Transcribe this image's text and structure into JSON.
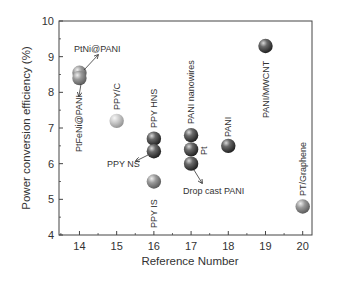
{
  "chart_data": {
    "type": "scatter",
    "title": "",
    "xlabel": "Reference Number",
    "ylabel": "Power conversion efficiency (%)",
    "xlim": [
      13.45,
      20.25
    ],
    "ylim": [
      4,
      10
    ],
    "xticks": [
      14,
      15,
      16,
      17,
      18,
      19,
      20
    ],
    "yticks": [
      4,
      5,
      6,
      7,
      8,
      9,
      10
    ],
    "grid": false,
    "legend": "none",
    "points": [
      {
        "x": 14,
        "y": 8.55,
        "label": "PtNi@PANI",
        "shade": "gray"
      },
      {
        "x": 14,
        "y": 8.4,
        "label": "PtFeNi@PANI",
        "shade": "gray"
      },
      {
        "x": 15,
        "y": 7.2,
        "label": "PPY/C",
        "shade": "light"
      },
      {
        "x": 16,
        "y": 6.7,
        "label": "PPY HNS",
        "shade": "dark"
      },
      {
        "x": 16,
        "y": 6.35,
        "label": "PPY NS",
        "shade": "dark"
      },
      {
        "x": 16,
        "y": 5.5,
        "label": "PPY IS",
        "shade": "gray"
      },
      {
        "x": 17,
        "y": 6.8,
        "label": "PANI nanowires",
        "shade": "dark"
      },
      {
        "x": 17,
        "y": 6.4,
        "label": "Pt",
        "shade": "dark"
      },
      {
        "x": 17,
        "y": 6.0,
        "label": "Drop cast PANI",
        "shade": "dark"
      },
      {
        "x": 18,
        "y": 6.5,
        "label": "PANI",
        "shade": "dark"
      },
      {
        "x": 19,
        "y": 9.3,
        "label": "PANI/MWCNT",
        "shade": "dark"
      },
      {
        "x": 20,
        "y": 4.8,
        "label": "PT/Graphene",
        "shade": "gray"
      }
    ]
  },
  "annotations": {
    "ptni": "PtNi@PANI",
    "ptfeni": "PtFeNi@PANI",
    "ppyc": "PPY/C",
    "ppyhns": "PPY HNS",
    "ppyns": "PPY NS",
    "ppyis": "PPY IS",
    "paninw": "PANI nanowires",
    "pt": "Pt",
    "dropcast": "Drop cast PANI",
    "pani": "PANI",
    "mwcnt": "PANI/MWCNT",
    "graphene": "PT/Graphene"
  },
  "colors": {
    "dark": "#2f2f2f",
    "gray": "#6e6e6e",
    "light": "#b5b5b5",
    "axis": "#444444"
  }
}
